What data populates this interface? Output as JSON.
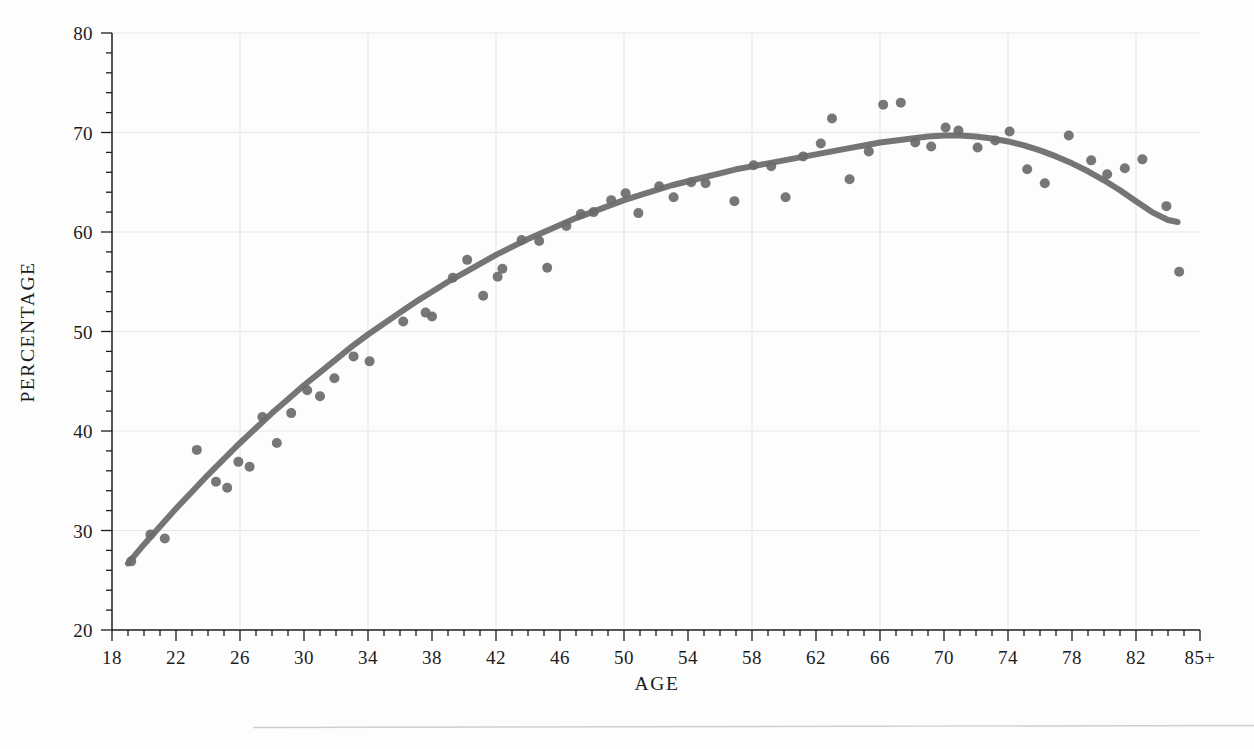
{
  "figure": {
    "background_color": "#fdfdfd",
    "ink_color": "#6b6b6b",
    "axis_color": "#1c1c1c",
    "grid_color": "#e8e8e8",
    "rule_color": "#c9c9c9"
  },
  "chart_data": {
    "type": "scatter",
    "title": "",
    "subtitle": "",
    "xlabel": "AGE",
    "ylabel": "PERCENTAGE",
    "xlim": [
      18,
      86
    ],
    "ylim": [
      20,
      80
    ],
    "grid": true,
    "legend": "none",
    "x_tick_labels": [
      "18",
      "22",
      "26",
      "30",
      "34",
      "38",
      "42",
      "46",
      "50",
      "54",
      "58",
      "62",
      "66",
      "70",
      "74",
      "78",
      "82",
      "85+"
    ],
    "x_tick_values": [
      18,
      22,
      26,
      30,
      34,
      38,
      42,
      46,
      50,
      54,
      58,
      62,
      66,
      70,
      74,
      78,
      82,
      86
    ],
    "x_minor_step": 1,
    "x_gridline_values": [
      26,
      34,
      42,
      50,
      58,
      66,
      74,
      82
    ],
    "y_tick_labels": [
      "20",
      "30",
      "40",
      "50",
      "60",
      "70",
      "80"
    ],
    "y_tick_values": [
      20,
      30,
      40,
      50,
      60,
      70,
      80
    ],
    "y_minor_step": 2,
    "y_gridline_values": [
      30,
      40,
      50,
      60,
      70,
      80
    ],
    "series": [
      {
        "name": "observed",
        "type": "scatter",
        "color": "#6b6b6b",
        "marker": "circle",
        "marker_size": 5,
        "points": [
          [
            19.2,
            26.9
          ],
          [
            20.4,
            29.6
          ],
          [
            21.3,
            29.2
          ],
          [
            23.3,
            38.1
          ],
          [
            24.5,
            34.9
          ],
          [
            25.2,
            34.3
          ],
          [
            25.9,
            36.9
          ],
          [
            26.6,
            36.4
          ],
          [
            27.4,
            41.4
          ],
          [
            28.3,
            38.8
          ],
          [
            29.2,
            41.8
          ],
          [
            30.2,
            44.1
          ],
          [
            31.0,
            43.5
          ],
          [
            31.9,
            45.3
          ],
          [
            33.1,
            47.5
          ],
          [
            34.1,
            47.0
          ],
          [
            36.2,
            51.0
          ],
          [
            37.6,
            51.9
          ],
          [
            38.0,
            51.5
          ],
          [
            39.3,
            55.4
          ],
          [
            40.2,
            57.2
          ],
          [
            41.2,
            53.6
          ],
          [
            42.1,
            55.5
          ],
          [
            42.4,
            56.3
          ],
          [
            43.6,
            59.2
          ],
          [
            44.7,
            59.1
          ],
          [
            45.2,
            56.4
          ],
          [
            46.4,
            60.6
          ],
          [
            47.3,
            61.8
          ],
          [
            48.1,
            62.0
          ],
          [
            49.2,
            63.2
          ],
          [
            50.1,
            63.9
          ],
          [
            50.9,
            61.9
          ],
          [
            52.2,
            64.6
          ],
          [
            53.1,
            63.5
          ],
          [
            54.2,
            65.0
          ],
          [
            55.1,
            64.9
          ],
          [
            56.9,
            63.1
          ],
          [
            58.1,
            66.7
          ],
          [
            59.2,
            66.6
          ],
          [
            60.1,
            63.5
          ],
          [
            61.2,
            67.6
          ],
          [
            62.3,
            68.9
          ],
          [
            63.0,
            71.4
          ],
          [
            64.1,
            65.3
          ],
          [
            65.3,
            68.1
          ],
          [
            66.2,
            72.8
          ],
          [
            67.3,
            73.0
          ],
          [
            68.2,
            69.0
          ],
          [
            69.2,
            68.6
          ],
          [
            70.1,
            70.5
          ],
          [
            70.9,
            70.2
          ],
          [
            72.1,
            68.5
          ],
          [
            73.2,
            69.2
          ],
          [
            74.1,
            70.1
          ],
          [
            75.2,
            66.3
          ],
          [
            76.3,
            64.9
          ],
          [
            77.8,
            69.7
          ],
          [
            79.2,
            67.2
          ],
          [
            80.2,
            65.8
          ],
          [
            81.3,
            66.4
          ],
          [
            82.4,
            67.3
          ],
          [
            83.9,
            62.6
          ],
          [
            84.7,
            56.0
          ]
        ]
      },
      {
        "name": "fitted-curve",
        "type": "line",
        "color": "#6b6b6b",
        "line_width": 6,
        "points": [
          [
            19.0,
            26.7
          ],
          [
            20.0,
            28.6
          ],
          [
            21.0,
            30.4
          ],
          [
            22.0,
            32.2
          ],
          [
            23.0,
            33.9
          ],
          [
            24.0,
            35.6
          ],
          [
            25.0,
            37.2
          ],
          [
            26.0,
            38.8
          ],
          [
            27.0,
            40.3
          ],
          [
            28.0,
            41.8
          ],
          [
            29.0,
            43.2
          ],
          [
            30.0,
            44.6
          ],
          [
            31.0,
            45.9
          ],
          [
            32.0,
            47.2
          ],
          [
            33.0,
            48.5
          ],
          [
            34.0,
            49.7
          ],
          [
            35.0,
            50.8
          ],
          [
            36.0,
            51.9
          ],
          [
            37.0,
            53.0
          ],
          [
            38.0,
            54.0
          ],
          [
            39.0,
            55.0
          ],
          [
            40.0,
            55.9
          ],
          [
            41.0,
            56.8
          ],
          [
            42.0,
            57.7
          ],
          [
            43.0,
            58.5
          ],
          [
            44.0,
            59.3
          ],
          [
            45.0,
            60.0
          ],
          [
            46.0,
            60.7
          ],
          [
            47.0,
            61.4
          ],
          [
            48.0,
            62.0
          ],
          [
            49.0,
            62.6
          ],
          [
            50.0,
            63.2
          ],
          [
            51.0,
            63.7
          ],
          [
            52.0,
            64.2
          ],
          [
            53.0,
            64.7
          ],
          [
            54.0,
            65.1
          ],
          [
            55.0,
            65.5
          ],
          [
            56.0,
            65.9
          ],
          [
            57.0,
            66.3
          ],
          [
            58.0,
            66.6
          ],
          [
            59.0,
            66.9
          ],
          [
            60.0,
            67.2
          ],
          [
            61.0,
            67.5
          ],
          [
            62.0,
            67.8
          ],
          [
            63.0,
            68.1
          ],
          [
            64.0,
            68.4
          ],
          [
            65.0,
            68.7
          ],
          [
            66.0,
            69.0
          ],
          [
            67.0,
            69.2
          ],
          [
            68.0,
            69.4
          ],
          [
            69.0,
            69.6
          ],
          [
            70.0,
            69.7
          ],
          [
            71.0,
            69.7
          ],
          [
            72.0,
            69.6
          ],
          [
            73.0,
            69.4
          ],
          [
            74.0,
            69.1
          ],
          [
            75.0,
            68.7
          ],
          [
            76.0,
            68.2
          ],
          [
            77.0,
            67.6
          ],
          [
            78.0,
            66.9
          ],
          [
            79.0,
            66.1
          ],
          [
            80.0,
            65.2
          ],
          [
            81.0,
            64.2
          ],
          [
            82.0,
            63.1
          ],
          [
            83.0,
            62.0
          ],
          [
            84.0,
            61.2
          ],
          [
            84.6,
            61.0
          ]
        ]
      }
    ]
  }
}
